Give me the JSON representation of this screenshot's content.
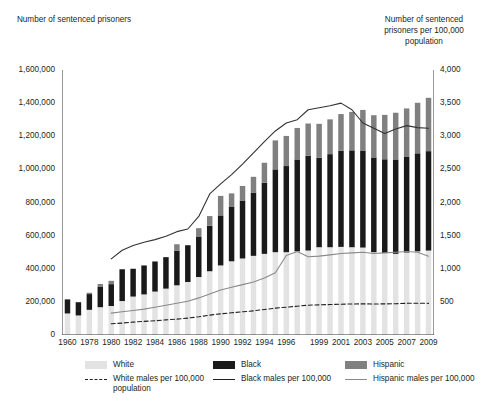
{
  "axes": {
    "left_title": "Number of sentenced prisoners",
    "right_title": "Number of sentenced prisoners per 100,000 population",
    "left_ticks": [
      "1,600,000",
      "1,400,000",
      "1,200,000",
      "1,000,000",
      "800,000",
      "600,000",
      "400,000",
      "200,000",
      "0"
    ],
    "right_ticks": [
      "4,000",
      "3,500",
      "3,000",
      "2,500",
      "2,000",
      "1,500",
      "1,000",
      "500",
      ""
    ]
  },
  "legend": {
    "white_bar": "White",
    "white_line": "White males per 100,000 population",
    "black_bar": "Black",
    "black_line": "Black males per 100,000",
    "hispanic_bar": "Hispanic",
    "hispanic_line": "Hispanic males per 100,000"
  },
  "colors": {
    "white_bar": "#e3e3e3",
    "black_bar": "#1a1a1a",
    "hispanic_bar": "#808080",
    "white_line": "#231f20",
    "black_line": "#333333",
    "hispanic_line": "#8a8a8a",
    "axis": "#231f20",
    "background": "#ffffff"
  },
  "chart_data": {
    "type": "bar",
    "title": "",
    "subtitle": "",
    "xlabel": "",
    "ylabel": "Number of sentenced prisoners",
    "y2label": "Number of sentenced prisoners per 100,000 population",
    "ylim": [
      0,
      1600000
    ],
    "y2lim": [
      0,
      4000
    ],
    "grid": false,
    "legend_position": "bottom",
    "stacked": true,
    "x": [
      1960,
      1970,
      1978,
      1979,
      1980,
      1981,
      1982,
      1983,
      1984,
      1985,
      1986,
      1987,
      1988,
      1989,
      1990,
      1991,
      1992,
      1993,
      1994,
      1995,
      1996,
      1997,
      1998,
      1999,
      2000,
      2001,
      2002,
      2003,
      2004,
      2005,
      2006,
      2007,
      2008,
      2009
    ],
    "xtick_labels": [
      "1960",
      "1970",
      "1978",
      "1979",
      "1980",
      "1981",
      "1982",
      "1983",
      "1984",
      "1985",
      "1986",
      "1987",
      "1988",
      "1989",
      "1990",
      "1991",
      "1992",
      "1993",
      "1994",
      "1995",
      "1996",
      "1997",
      "1998",
      "1999",
      "2000",
      "2001",
      "2002",
      "2003",
      "2004",
      "2005",
      "2006",
      "2007",
      "2008",
      "2009"
    ],
    "xticks_shown": [
      "1960",
      "1978",
      "1980",
      "1982",
      "1984",
      "1986",
      "1988",
      "1990",
      "1992",
      "1994",
      "1996",
      "1999",
      "2001",
      "2003",
      "2005",
      "2007",
      "2009"
    ],
    "series": [
      {
        "name": "White",
        "type": "bar-segment",
        "color": "#e3e3e3",
        "values": [
          130000,
          118000,
          152000,
          168000,
          175000,
          205000,
          232000,
          245000,
          262000,
          280000,
          300000,
          320000,
          350000,
          385000,
          420000,
          445000,
          462000,
          478000,
          490000,
          500000,
          500000,
          505000,
          510000,
          530000,
          530000,
          532000,
          530000,
          528000,
          500000,
          495000,
          490000,
          498000,
          505000,
          510000
        ]
      },
      {
        "name": "Black",
        "type": "bar-segment",
        "color": "#1a1a1a",
        "values": [
          85000,
          80000,
          95000,
          122000,
          132000,
          192000,
          168000,
          175000,
          182000,
          190000,
          208000,
          222000,
          245000,
          275000,
          302000,
          328000,
          350000,
          382000,
          430000,
          500000,
          520000,
          555000,
          572000,
          540000,
          562000,
          580000,
          585000,
          586000,
          572000,
          566000,
          570000,
          580000,
          592000,
          600000
        ]
      },
      {
        "name": "Hispanic",
        "type": "bar-segment",
        "color": "#808080",
        "values": [
          0,
          0,
          8000,
          18000,
          20000,
          0,
          0,
          0,
          0,
          0,
          40000,
          0,
          50000,
          58000,
          118000,
          82000,
          88000,
          95000,
          120000,
          175000,
          182000,
          190000,
          195000,
          205000,
          210000,
          222000,
          232000,
          245000,
          255000,
          268000,
          282000,
          290000,
          305000,
          322000
        ]
      },
      {
        "name": "Black males per 100,000",
        "type": "line",
        "axis": "right",
        "color": "#333333",
        "x": [
          1980,
          1981,
          1982,
          1983,
          1984,
          1985,
          1986,
          1987,
          1988,
          1989,
          1990,
          1991,
          1992,
          1993,
          1994,
          1995,
          1996,
          1997,
          1998,
          1999,
          2000,
          2001,
          2002,
          2003,
          2004,
          2005,
          2006,
          2007,
          2008,
          2009
        ],
        "values": [
          1150,
          1280,
          1350,
          1400,
          1440,
          1490,
          1560,
          1600,
          1790,
          2130,
          2280,
          2420,
          2580,
          2750,
          2920,
          3080,
          3200,
          3250,
          3400,
          3430,
          3460,
          3500,
          3400,
          3200,
          3120,
          3040,
          3110,
          3160,
          3130,
          3120
        ]
      },
      {
        "name": "Hispanic males per 100,000",
        "type": "line",
        "axis": "right",
        "color": "#8a8a8a",
        "x": [
          1980,
          1981,
          1982,
          1983,
          1984,
          1985,
          1986,
          1987,
          1988,
          1989,
          1990,
          1991,
          1992,
          1993,
          1994,
          1995,
          1996,
          1997,
          1998,
          1999,
          2000,
          2001,
          2002,
          2003,
          2004,
          2005,
          2006,
          2007,
          2008,
          2009
        ],
        "values": [
          330,
          350,
          370,
          390,
          420,
          450,
          480,
          510,
          560,
          620,
          680,
          720,
          760,
          800,
          860,
          940,
          1200,
          1260,
          1180,
          1190,
          1210,
          1230,
          1240,
          1250,
          1230,
          1240,
          1250,
          1260,
          1250,
          1190
        ]
      },
      {
        "name": "White males per 100,000 population",
        "type": "line",
        "axis": "right",
        "color": "#231f20",
        "dashed": true,
        "x": [
          1980,
          1981,
          1982,
          1983,
          1984,
          1985,
          1986,
          1987,
          1988,
          1989,
          1990,
          1991,
          1992,
          1993,
          1994,
          1995,
          1996,
          1997,
          1998,
          1999,
          2000,
          2001,
          2002,
          2003,
          2004,
          2005,
          2006,
          2007,
          2008,
          2009
        ],
        "values": [
          170,
          180,
          195,
          205,
          215,
          228,
          240,
          255,
          275,
          300,
          320,
          335,
          350,
          365,
          385,
          405,
          420,
          435,
          450,
          455,
          460,
          465,
          468,
          470,
          468,
          470,
          472,
          478,
          480,
          478
        ]
      }
    ]
  }
}
